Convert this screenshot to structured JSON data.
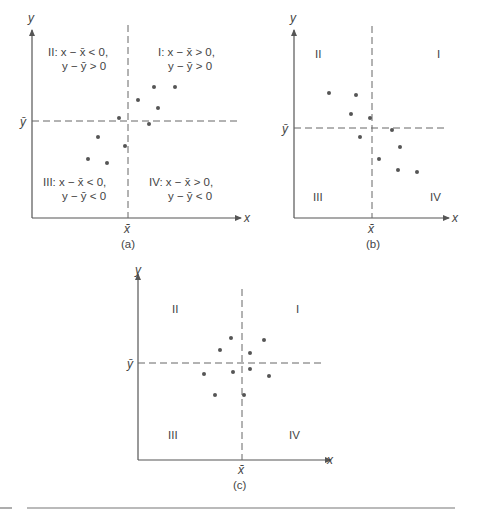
{
  "chart_data": [
    {
      "type": "scatter",
      "caption": "(a)",
      "xlabel": "x",
      "ylabel": "y",
      "xbar_label": "x̄",
      "ybar_label": "ȳ",
      "grid": false,
      "quadrant_labels": {
        "I": [
          "I: x − x̄ > 0,",
          "y − ȳ > 0"
        ],
        "II": [
          "II: x − x̄ < 0,",
          "y − ȳ > 0"
        ],
        "III": [
          "III: x − x̄ < 0,",
          "y − ȳ < 0"
        ],
        "IV": [
          "IV: x − x̄ > 0,",
          "y − ȳ < 0"
        ]
      },
      "points_px": [
        [
          154,
          87
        ],
        [
          175,
          87
        ],
        [
          138,
          100
        ],
        [
          158,
          108
        ],
        [
          119,
          118
        ],
        [
          149,
          124
        ],
        [
          98,
          137
        ],
        [
          125,
          146
        ],
        [
          88,
          159
        ],
        [
          107,
          163
        ]
      ],
      "relationship": "positive"
    },
    {
      "type": "scatter",
      "caption": "(b)",
      "xlabel": "x",
      "ylabel": "y",
      "xbar_label": "x̄",
      "ybar_label": "ȳ",
      "grid": false,
      "quadrant_labels": {
        "I": "I",
        "II": "II",
        "III": "III",
        "IV": "IV"
      },
      "points_px": [
        [
          329,
          93
        ],
        [
          356,
          95
        ],
        [
          351,
          114
        ],
        [
          370,
          118
        ],
        [
          392,
          130
        ],
        [
          360,
          137
        ],
        [
          400,
          147
        ],
        [
          379,
          159
        ],
        [
          398,
          170
        ],
        [
          417,
          172
        ]
      ],
      "relationship": "negative"
    },
    {
      "type": "scatter",
      "caption": "(c)",
      "xlabel": "x",
      "ylabel": "y",
      "xbar_label": "x̄",
      "ybar_label": "ȳ",
      "grid": false,
      "quadrant_labels": {
        "I": "I",
        "II": "II",
        "III": "III",
        "IV": "IV"
      },
      "points_px": [
        [
          231,
          338
        ],
        [
          264,
          340
        ],
        [
          220,
          350
        ],
        [
          250,
          353
        ],
        [
          204,
          374
        ],
        [
          233,
          372
        ],
        [
          250,
          369
        ],
        [
          269,
          376
        ],
        [
          215,
          395
        ],
        [
          244,
          395
        ]
      ],
      "relationship": "none"
    }
  ]
}
